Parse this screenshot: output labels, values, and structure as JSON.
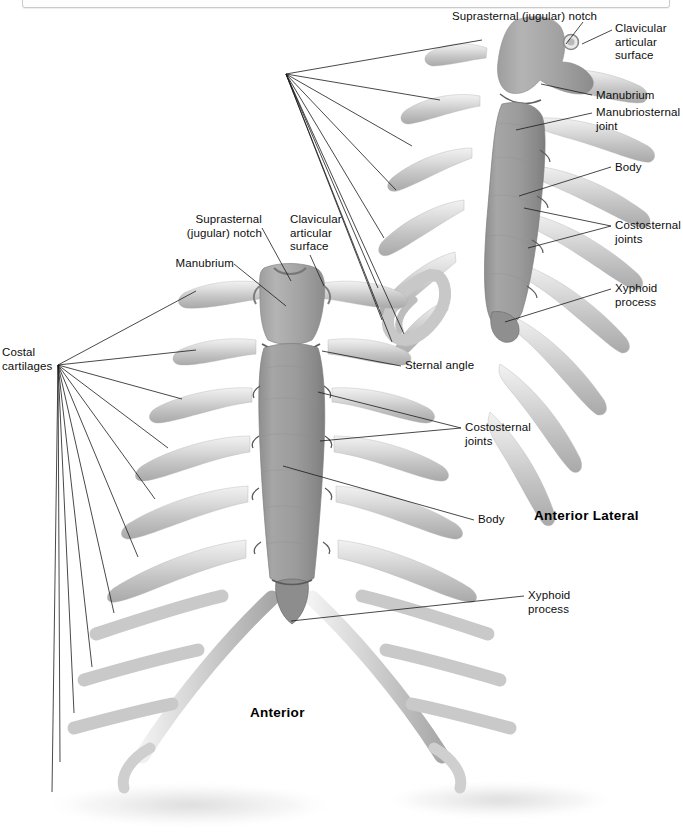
{
  "window": {
    "top_strip_visible": true
  },
  "figure": {
    "background_color": "#ffffff",
    "bone_color_sternum": "#9a9a9a",
    "bone_color_cartilage": "#d4d4d4",
    "leader_line_color": "#1a1a1a",
    "text_color": "#0d0d0d"
  },
  "views": [
    {
      "id": "anterior-lateral",
      "caption": "Anterior Lateral",
      "caption_position": {
        "x": 534,
        "y": 508
      }
    },
    {
      "id": "anterior",
      "caption": "Anterior",
      "caption_position": {
        "x": 250,
        "y": 705
      }
    }
  ],
  "labels": {
    "lateral": [
      {
        "id": "suprasternal-notch",
        "text": "Suprasternal (jugular) notch",
        "align": "left",
        "x": 452,
        "y": 10,
        "anchor": {
          "x": 583,
          "y": 22
        },
        "leader_end": {
          "x": 566,
          "y": 42
        }
      },
      {
        "id": "clavicular-articular-surface",
        "text": "Clavicular\narticular\nsurface",
        "align": "left",
        "x": 615,
        "y": 22,
        "anchor": {
          "x": 612,
          "y": 30
        },
        "leader_end": {
          "x": 583,
          "y": 48
        }
      },
      {
        "id": "manubrium",
        "text": "Manubrium",
        "align": "left",
        "x": 596,
        "y": 89,
        "anchor": {
          "x": 592,
          "y": 95
        },
        "leader_end": {
          "x": 541,
          "y": 84
        }
      },
      {
        "id": "manubriosternal-joint",
        "text": "Manubriosternal\njoint",
        "align": "left",
        "x": 596,
        "y": 107,
        "anchor": {
          "x": 592,
          "y": 113
        },
        "leader_end": {
          "x": 516,
          "y": 129
        }
      },
      {
        "id": "body",
        "text": "Body",
        "align": "left",
        "x": 615,
        "y": 161,
        "anchor": {
          "x": 611,
          "y": 167
        },
        "leader_end": {
          "x": 519,
          "y": 196
        }
      },
      {
        "id": "costosternal-joints",
        "text": "Costosternal\njoints",
        "align": "left",
        "x": 615,
        "y": 220,
        "anchor": {
          "x": 611,
          "y": 226
        },
        "leader_ends": [
          {
            "x": 524,
            "y": 209
          },
          {
            "x": 528,
            "y": 247
          }
        ]
      },
      {
        "id": "xyphoid-process",
        "text": "Xyphoid\nprocess",
        "align": "left",
        "x": 615,
        "y": 283,
        "anchor": {
          "x": 611,
          "y": 289
        },
        "leader_end": {
          "x": 505,
          "y": 322
        }
      }
    ],
    "anterior": [
      {
        "id": "suprasternal-notch",
        "text": "Suprasternal\n(jugular) notch",
        "align": "right",
        "x": 176,
        "y": 214,
        "anchor": {
          "x": 262,
          "y": 228
        },
        "leader_end": {
          "x": 287,
          "y": 280
        }
      },
      {
        "id": "clavicular-articular-surface",
        "text": "Clavicular\narticular\nsurface",
        "align": "left",
        "x": 290,
        "y": 214,
        "anchor": {
          "x": 310,
          "y": 255
        },
        "leader_end": {
          "x": 323,
          "y": 284
        }
      },
      {
        "id": "manubrium",
        "text": "Manubrium",
        "align": "right",
        "x": 168,
        "y": 258,
        "anchor": {
          "x": 234,
          "y": 264
        },
        "leader_end": {
          "x": 285,
          "y": 305
        }
      },
      {
        "id": "costal-cartilages",
        "text": "Costal\ncartilages",
        "align": "left",
        "x": 2,
        "y": 347,
        "anchor": {
          "x": 58,
          "y": 365
        },
        "leader_ends": [
          {
            "x": 192,
            "y": 290
          },
          {
            "x": 196,
            "y": 350
          },
          {
            "x": 182,
            "y": 398
          },
          {
            "x": 168,
            "y": 447
          },
          {
            "x": 155,
            "y": 498
          },
          {
            "x": 138,
            "y": 556
          },
          {
            "x": 114,
            "y": 612
          },
          {
            "x": 92,
            "y": 666
          },
          {
            "x": 72,
            "y": 712
          },
          {
            "x": 58,
            "y": 760
          },
          {
            "x": 52,
            "y": 790
          }
        ]
      },
      {
        "id": "sternal-angle",
        "text": "Sternal angle",
        "align": "left",
        "x": 405,
        "y": 360,
        "anchor": {
          "x": 401,
          "y": 366
        },
        "leader_end": {
          "x": 322,
          "y": 352
        }
      },
      {
        "id": "costosternal-joints",
        "text": "Costosternal\njoints",
        "align": "left",
        "x": 465,
        "y": 422,
        "anchor": {
          "x": 461,
          "y": 428
        },
        "leader_ends": [
          {
            "x": 318,
            "y": 392
          },
          {
            "x": 320,
            "y": 440
          }
        ]
      },
      {
        "id": "body",
        "text": "Body",
        "align": "left",
        "x": 478,
        "y": 514,
        "anchor": {
          "x": 474,
          "y": 520
        },
        "leader_end": {
          "x": 283,
          "y": 466
        }
      },
      {
        "id": "xyphoid-process",
        "text": "Xyphoid\nprocess",
        "align": "left",
        "x": 528,
        "y": 590,
        "anchor": {
          "x": 524,
          "y": 596
        },
        "leader_end": {
          "x": 291,
          "y": 621
        }
      }
    ]
  }
}
